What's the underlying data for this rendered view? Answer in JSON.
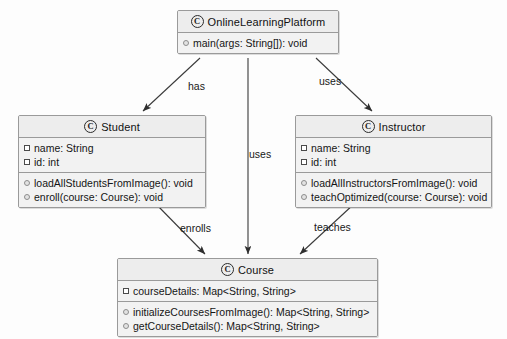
{
  "diagram": {
    "background_color": "#fdfdfd",
    "box_fill": "#f2f2f2",
    "header_fill": "#ededed",
    "border_color": "#9a9a9a",
    "line_color": "#3a3a3a",
    "class_glyph": "C"
  },
  "classes": {
    "platform": {
      "name": "OnlineLearningPlatform",
      "attributes": [],
      "methods": [
        {
          "text": "main(args: String[]): void"
        }
      ]
    },
    "student": {
      "name": "Student",
      "attributes": [
        {
          "text": "name: String"
        },
        {
          "text": "id: int"
        }
      ],
      "methods": [
        {
          "text": "loadAllStudentsFromImage(): void"
        },
        {
          "text": "enroll(course: Course): void"
        }
      ]
    },
    "instructor": {
      "name": "Instructor",
      "attributes": [
        {
          "text": "name: String"
        },
        {
          "text": "id: int"
        }
      ],
      "methods": [
        {
          "text": "loadAllInstructorsFromImage(): void"
        },
        {
          "text": "teachOptimized(course: Course): void"
        }
      ]
    },
    "course": {
      "name": "Course",
      "attributes": [
        {
          "text": "courseDetails: Map<String, String>"
        }
      ],
      "methods": [
        {
          "text": "initializeCoursesFromImage(): Map<String, String>"
        },
        {
          "text": "getCourseDetails(): Map<String, String>"
        }
      ]
    }
  },
  "edges": [
    {
      "id": "platform-student",
      "label": "has",
      "from": "OnlineLearningPlatform",
      "to": "Student"
    },
    {
      "id": "platform-instructor",
      "label": "uses",
      "from": "OnlineLearningPlatform",
      "to": "Instructor"
    },
    {
      "id": "platform-course",
      "label": "uses",
      "from": "OnlineLearningPlatform",
      "to": "Course"
    },
    {
      "id": "student-course",
      "label": "enrolls",
      "from": "Student",
      "to": "Course"
    },
    {
      "id": "instructor-course",
      "label": "teaches",
      "from": "Instructor",
      "to": "Course"
    }
  ]
}
